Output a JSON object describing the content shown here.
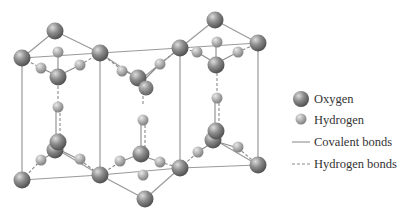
{
  "legend": {
    "items": [
      {
        "label": "Oxygen",
        "symbol": "large-sphere"
      },
      {
        "label": "Hydrogen",
        "symbol": "small-sphere"
      },
      {
        "label": "Covalent bonds",
        "symbol": "solid-line"
      },
      {
        "label": "Hydrogen bonds",
        "symbol": "dashed-line"
      }
    ]
  },
  "colors": {
    "oxygen": "#7a7a7a",
    "hydrogen": "#a8a8a8",
    "bond": "#8a8a8a",
    "frame": "#999999",
    "text": "#333333"
  }
}
